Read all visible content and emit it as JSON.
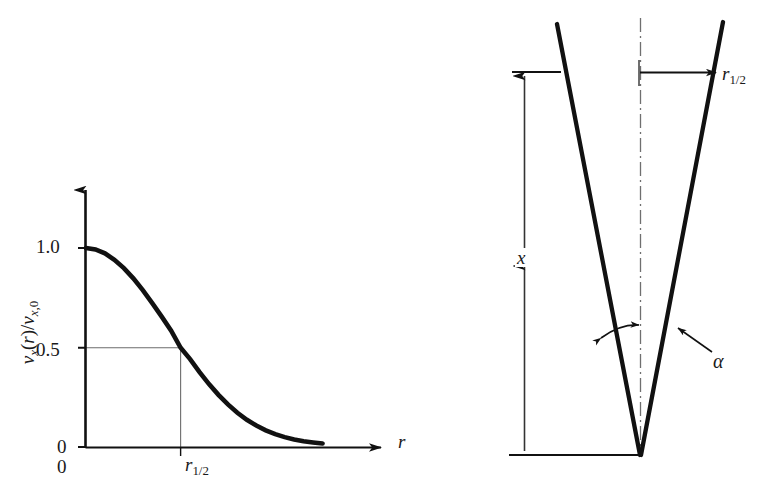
{
  "figure": {
    "background": "#ffffff",
    "stroke": "#111111",
    "thin_stroke": "#555555"
  },
  "left_plot": {
    "name": "velocity-profile-plot",
    "y_axis_label": "v<sub>x</sub>(r)/v<sub>x,0</sub>",
    "y_axis_label_plain": "v_x(r)/v_x,0",
    "x_axis_label": "r",
    "y_ticks": [
      "1.0",
      "0.5",
      "0"
    ],
    "x_ticks": [
      "0",
      "r_1/2"
    ],
    "x_tick_origin": "0",
    "x_tick_half": "r",
    "x_tick_half_sub": "1/2",
    "guides": "thin lines from y=0.5 to curve and down to x-axis at r_1/2"
  },
  "right_diagram": {
    "name": "jet-spread-diagram",
    "axial_distance_label": "x",
    "half_radius_label": "r",
    "half_radius_sub": "1/2",
    "angle_label": "α",
    "centerline_style": "dash-dot"
  },
  "chart_data": {
    "type": "line",
    "title": "",
    "xlabel": "r",
    "ylabel": "v_x(r)/v_x,0",
    "xlim": [
      0,
      2.6
    ],
    "ylim": [
      0,
      1.05
    ],
    "grid": false,
    "legend": "none",
    "yticks": [
      0,
      0.5,
      1.0
    ],
    "ytick_labels": [
      "0",
      "0.5",
      "1.0"
    ],
    "xticks": [
      0,
      1.0
    ],
    "xtick_labels": [
      "0",
      "r_1/2"
    ],
    "annotations": [
      {
        "text": "0.5 crossing at r = r_1/2",
        "x": 1.0,
        "y": 0.5
      }
    ],
    "series": [
      {
        "name": "v_x(r)/v_x,0",
        "x": [
          0.0,
          0.1,
          0.2,
          0.3,
          0.4,
          0.5,
          0.6,
          0.7,
          0.8,
          0.9,
          1.0,
          1.1,
          1.2,
          1.3,
          1.4,
          1.5,
          1.6,
          1.7,
          1.8,
          1.9,
          2.0,
          2.1,
          2.2,
          2.3,
          2.4,
          2.5
        ],
        "values": [
          1.0,
          0.993,
          0.973,
          0.941,
          0.899,
          0.848,
          0.789,
          0.724,
          0.656,
          0.586,
          0.5,
          0.443,
          0.378,
          0.318,
          0.264,
          0.216,
          0.174,
          0.139,
          0.11,
          0.086,
          0.067,
          0.052,
          0.04,
          0.031,
          0.025,
          0.02
        ]
      }
    ]
  }
}
